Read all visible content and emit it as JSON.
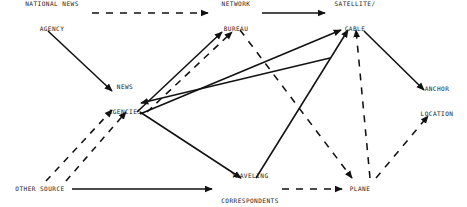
{
  "diagram": {
    "canvas": {
      "width": 467,
      "height": 207
    },
    "background_color": "#ffffff",
    "line_color": "#111111",
    "text_color": "#1a1a1a",
    "nodes": [
      {
        "id": "national-news-agency",
        "lines": [
          "NATIONAL NEWS",
          "AGENCY"
        ],
        "x": 52,
        "y": 17
      },
      {
        "id": "network-bureau",
        "lines": [
          "NETWORK",
          "BUREAU"
        ],
        "x": 236,
        "y": 17
      },
      {
        "id": "satellite-cable",
        "lines": [
          "SATELLITE/",
          "CABLE"
        ],
        "x": 355,
        "y": 17
      },
      {
        "id": "news-agencies",
        "lines": [
          "NEWS",
          "AGENCIES"
        ],
        "x": 125,
        "y": 100
      },
      {
        "id": "anchor-location",
        "lines": [
          "ANCHOR",
          "LOCATION"
        ],
        "x": 437,
        "y": 102
      },
      {
        "id": "other-source",
        "lines": [
          "OTHER SOURCE"
        ],
        "x": 40,
        "y": 189
      },
      {
        "id": "traveling-correspondents",
        "lines": [
          "TRAVELING",
          "CORRESPONDENTS"
        ],
        "x": 250,
        "y": 189
      },
      {
        "id": "plane",
        "lines": [
          "PLANE"
        ],
        "x": 360,
        "y": 189
      }
    ],
    "edges": [
      {
        "id": "national-news-agency-to-network-bureau",
        "from": "national-news-agency",
        "to": "network-bureau",
        "style": "dashed",
        "arrow": true
      },
      {
        "id": "national-news-agency-to-news-agencies",
        "from": "national-news-agency",
        "to": "news-agencies",
        "style": "solid",
        "arrow": true
      },
      {
        "id": "news-agencies-to-network-bureau-solid",
        "from": "news-agencies",
        "to": "network-bureau",
        "style": "solid",
        "arrow": true
      },
      {
        "id": "news-agencies-to-network-bureau-dashed",
        "from": "news-agencies",
        "to": "network-bureau",
        "style": "dashed",
        "arrow": true
      },
      {
        "id": "news-agencies-to-satellite-cable",
        "from": "news-agencies",
        "to": "satellite-cable",
        "style": "solid",
        "arrow": true
      },
      {
        "id": "satellite-cable-to-news-agencies",
        "from": "satellite-cable",
        "to": "news-agencies",
        "style": "solid",
        "arrow": true
      },
      {
        "id": "network-bureau-to-satellite-cable",
        "from": "network-bureau",
        "to": "satellite-cable",
        "style": "solid",
        "arrow": true
      },
      {
        "id": "network-bureau-to-plane",
        "from": "network-bureau",
        "to": "plane",
        "style": "dashed",
        "arrow": true
      },
      {
        "id": "plane-to-satellite-cable",
        "from": "plane",
        "to": "satellite-cable",
        "style": "dashed",
        "arrow": true
      },
      {
        "id": "satellite-cable-to-anchor-location",
        "from": "satellite-cable",
        "to": "anchor-location",
        "style": "solid",
        "arrow": true
      },
      {
        "id": "plane-to-anchor-location",
        "from": "plane",
        "to": "anchor-location",
        "style": "dashed",
        "arrow": true
      },
      {
        "id": "news-agencies-to-traveling-correspondents",
        "from": "news-agencies",
        "to": "traveling-correspondents",
        "style": "solid",
        "arrow": true
      },
      {
        "id": "traveling-correspondents-to-satellite-cable",
        "from": "traveling-correspondents",
        "to": "satellite-cable",
        "style": "solid",
        "arrow": true
      },
      {
        "id": "traveling-correspondents-to-plane",
        "from": "traveling-correspondents",
        "to": "plane",
        "style": "dashed",
        "arrow": true
      },
      {
        "id": "other-source-to-traveling-correspondents",
        "from": "other-source",
        "to": "traveling-correspondents",
        "style": "solid",
        "arrow": true
      },
      {
        "id": "other-source-to-news-agencies-left",
        "from": "other-source",
        "to": "news-agencies",
        "style": "dashed",
        "arrow": true
      },
      {
        "id": "other-source-to-news-agencies-right",
        "from": "other-source",
        "to": "news-agencies",
        "style": "dashed",
        "arrow": true
      }
    ]
  }
}
